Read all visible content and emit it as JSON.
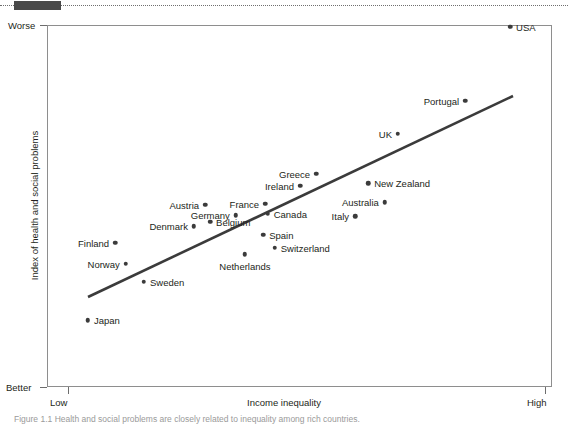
{
  "figure": {
    "caption": "Figure 1.1 Health and social problems are closely related to inequality among rich countries."
  },
  "chart_data": {
    "type": "scatter",
    "title": "",
    "xlabel": "Income inequality",
    "ylabel": "Index of health and social problems",
    "x_axis": {
      "low_label": "Low",
      "high_label": "High",
      "ticks": [
        "Low",
        "High"
      ]
    },
    "y_axis": {
      "low_label": "Better",
      "high_label": "Worse",
      "ticks": [
        "Worse",
        "Better"
      ]
    },
    "grid": false,
    "legend": false,
    "trendline": {
      "present": true,
      "color": "#3b3b3b",
      "direction": "positive"
    },
    "points": [
      {
        "name": "USA",
        "x": 0.917,
        "y": 0.995,
        "label_side": "right"
      },
      {
        "name": "Portugal",
        "x": 0.828,
        "y": 0.791,
        "label_side": "left"
      },
      {
        "name": "UK",
        "x": 0.695,
        "y": 0.7,
        "label_side": "left"
      },
      {
        "name": "Greece",
        "x": 0.533,
        "y": 0.589,
        "label_side": "left"
      },
      {
        "name": "Ireland",
        "x": 0.501,
        "y": 0.556,
        "label_side": "left"
      },
      {
        "name": "New Zealand",
        "x": 0.636,
        "y": 0.563,
        "label_side": "right"
      },
      {
        "name": "Austria",
        "x": 0.313,
        "y": 0.503,
        "label_side": "left"
      },
      {
        "name": "France",
        "x": 0.432,
        "y": 0.506,
        "label_side": "left"
      },
      {
        "name": "Australia",
        "x": 0.669,
        "y": 0.511,
        "label_side": "left"
      },
      {
        "name": "Germany",
        "x": 0.374,
        "y": 0.475,
        "label_side": "left"
      },
      {
        "name": "Canada",
        "x": 0.437,
        "y": 0.478,
        "label_side": "right"
      },
      {
        "name": "Italy",
        "x": 0.61,
        "y": 0.472,
        "label_side": "left"
      },
      {
        "name": "Denmark",
        "x": 0.291,
        "y": 0.444,
        "label_side": "left"
      },
      {
        "name": "Belgium",
        "x": 0.323,
        "y": 0.456,
        "label_side": "right"
      },
      {
        "name": "Spain",
        "x": 0.428,
        "y": 0.42,
        "label_side": "right"
      },
      {
        "name": "Finland",
        "x": 0.135,
        "y": 0.398,
        "label_side": "left"
      },
      {
        "name": "Switzerland",
        "x": 0.451,
        "y": 0.384,
        "label_side": "right"
      },
      {
        "name": "Netherlands",
        "x": 0.392,
        "y": 0.367,
        "label_side": "below"
      },
      {
        "name": "Norway",
        "x": 0.156,
        "y": 0.34,
        "label_side": "left"
      },
      {
        "name": "Sweden",
        "x": 0.192,
        "y": 0.291,
        "label_side": "right"
      },
      {
        "name": "Japan",
        "x": 0.081,
        "y": 0.185,
        "label_side": "right"
      }
    ]
  }
}
